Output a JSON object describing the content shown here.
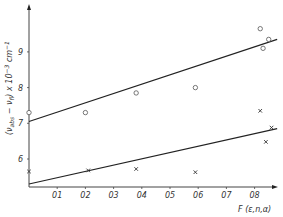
{
  "chart_data": {
    "type": "scatter",
    "title": "",
    "xlabel": "F (ε,n,α)",
    "ylabel": "(ν_abs − ν_fl) x 10^-3 cm^-1",
    "xlim": [
      0,
      0.9
    ],
    "ylim": [
      5.2,
      10.3
    ],
    "x_ticks": [
      0.1,
      0.2,
      0.3,
      0.4,
      0.5,
      0.6,
      0.7,
      0.8
    ],
    "x_tick_labels": [
      "0,1",
      "0,2",
      "0,3",
      "0,4",
      "0,5",
      "0,6",
      "0,7",
      "0,8"
    ],
    "y_ticks": [
      6,
      7,
      8,
      9
    ],
    "y_tick_labels": [
      "6",
      "7",
      "8",
      "9"
    ],
    "grid": false,
    "legend": null,
    "series": [
      {
        "name": "circles",
        "marker": "o",
        "points": [
          {
            "x": 0.0,
            "y": 7.3
          },
          {
            "x": 0.2,
            "y": 7.3
          },
          {
            "x": 0.38,
            "y": 7.85
          },
          {
            "x": 0.59,
            "y": 8.0
          },
          {
            "x": 0.82,
            "y": 9.65
          },
          {
            "x": 0.85,
            "y": 9.35
          },
          {
            "x": 0.83,
            "y": 9.1
          }
        ],
        "fit_line": {
          "x": [
            0.0,
            0.88
          ],
          "y": [
            7.05,
            9.35
          ]
        }
      },
      {
        "name": "crosses",
        "marker": "x",
        "points": [
          {
            "x": 0.0,
            "y": 5.65
          },
          {
            "x": 0.21,
            "y": 5.68
          },
          {
            "x": 0.38,
            "y": 5.72
          },
          {
            "x": 0.59,
            "y": 5.63
          },
          {
            "x": 0.82,
            "y": 7.35
          },
          {
            "x": 0.86,
            "y": 6.88
          },
          {
            "x": 0.84,
            "y": 6.48
          }
        ],
        "fit_line": {
          "x": [
            0.0,
            0.88
          ],
          "y": [
            5.3,
            6.85
          ]
        }
      }
    ]
  },
  "labels": {
    "xlabel": "F (ε,n,α)",
    "ylabel_main": "(ν",
    "ylabel_sub1": "abs",
    "ylabel_mid": " − ν",
    "ylabel_sub2": "fl",
    "ylabel_tail": ") x 10",
    "ylabel_sup1": "−3",
    "ylabel_unit": " cm",
    "ylabel_sup2": "−1"
  }
}
